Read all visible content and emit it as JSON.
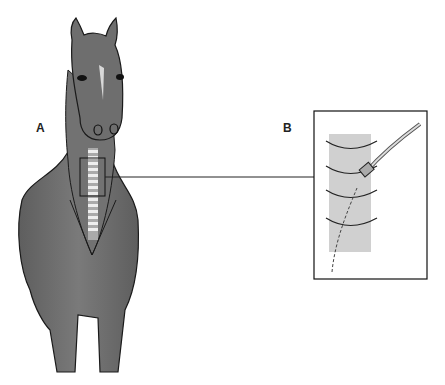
{
  "labels": {
    "a": "A",
    "b": "B"
  },
  "figure": {
    "inset": "tracheal catheter / tube inserted between tracheal rings"
  },
  "colors": {
    "horse_body": "#6b6b6b",
    "outline": "#1a1a1a",
    "trachea": "#c9c9c9",
    "line": "#222222"
  }
}
